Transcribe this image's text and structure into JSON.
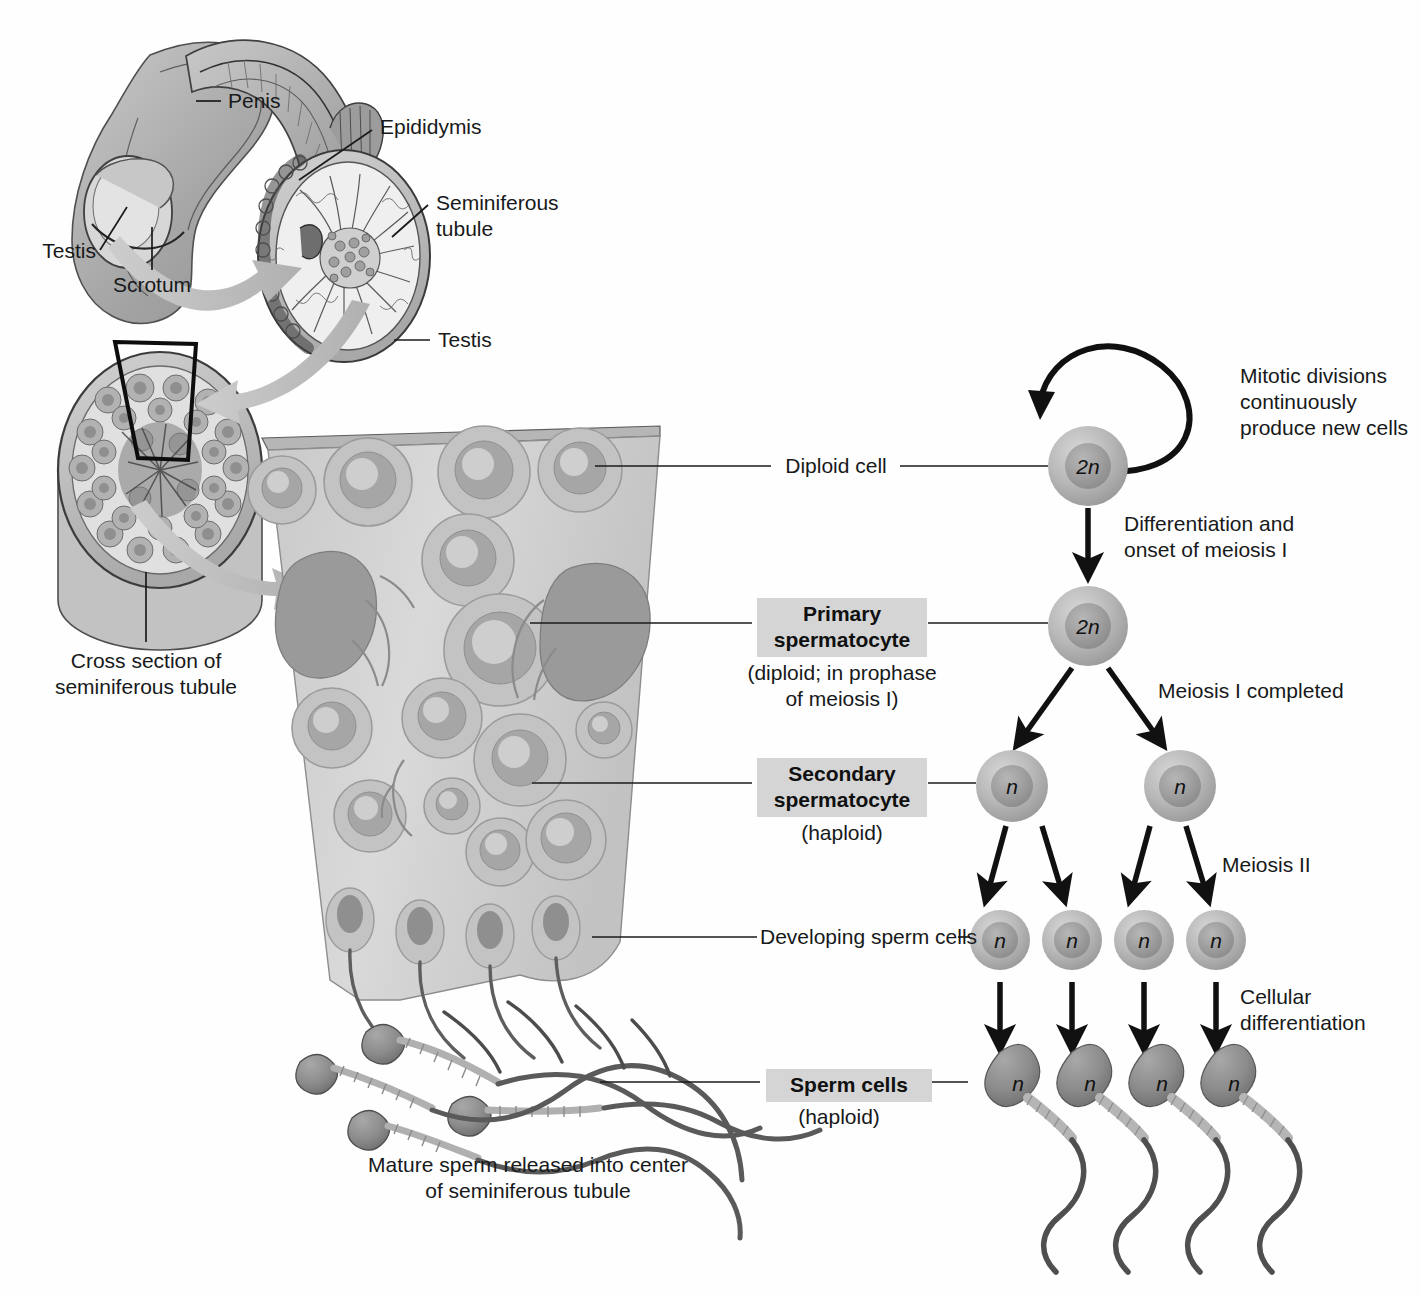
{
  "figure": {
    "background_color": "#fefefe",
    "text_color": "#17191a",
    "highlight_box_color": "#d5d5d5"
  },
  "anatomy_labels": [
    {
      "id": "penis",
      "text": "Penis"
    },
    {
      "id": "testis_left",
      "text": "Testis"
    },
    {
      "id": "scrotum",
      "text": "Scrotum"
    },
    {
      "id": "epididymis",
      "text": "Epididymis"
    },
    {
      "id": "seminiferous_tubule",
      "text": "Seminiferous\ntubule"
    },
    {
      "id": "testis_right",
      "text": "Testis"
    },
    {
      "id": "cross_section",
      "text": "Cross section of\nseminiferous tubule"
    }
  ],
  "caption": {
    "mature_sperm": "Mature sperm released into center\nof seminiferous tubule"
  },
  "stage_labels": [
    {
      "id": "diploid-cell",
      "text": "Diploid cell",
      "boxed": false,
      "subtitle": ""
    },
    {
      "id": "primary-spermatocyte",
      "text": "Primary\nspermatocyte",
      "boxed": true,
      "subtitle": "(diploid; in prophase\nof meiosis I)"
    },
    {
      "id": "secondary-spermatocyte",
      "text": "Secondary\nspermatocyte",
      "boxed": true,
      "subtitle": "(haploid)"
    },
    {
      "id": "developing-sperm-cells",
      "text": "Developing sperm cells",
      "boxed": false,
      "subtitle": ""
    },
    {
      "id": "sperm-cells",
      "text": "Sperm cells",
      "boxed": true,
      "subtitle": "(haploid)"
    }
  ],
  "process_labels": [
    {
      "id": "mitotic-divisions",
      "text": "Mitotic divisions\ncontinuously\nproduce new cells"
    },
    {
      "id": "differentiation-onset",
      "text": "Differentiation and\nonset of meiosis I"
    },
    {
      "id": "meiosis-one-completed",
      "text": "Meiosis I completed"
    },
    {
      "id": "meiosis-two",
      "text": "Meiosis II"
    },
    {
      "id": "cellular-differentiation",
      "text": "Cellular\ndifferentiation"
    }
  ],
  "cells": {
    "diploid_stem": {
      "ploidy": "2n",
      "count": 1
    },
    "primary_spermatocyte": {
      "ploidy": "2n",
      "count": 1
    },
    "secondary_spermatocyte": {
      "ploidy": "n",
      "count": 2
    },
    "developing_sperm": {
      "ploidy": "n",
      "count": 4
    },
    "sperm": {
      "ploidy": "n",
      "count": 4
    }
  },
  "icons": {
    "arrow_thick": "thick-gray-arrow-icon",
    "arrow_division": "black-division-arrow-icon",
    "arrow_loop": "mitosis-loop-arrow-icon"
  }
}
